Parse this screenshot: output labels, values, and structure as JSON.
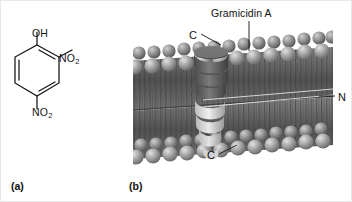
{
  "figure": {
    "parts": [
      {
        "letter": "(a)",
        "caption_icon": "chemical-structure"
      },
      {
        "letter": "(b)",
        "caption_icon": "membrane-diagram"
      }
    ]
  },
  "panel_a": {
    "molecule_name": "2,4-dinitrophenol",
    "labels": {
      "hydroxyl": "OH",
      "nitro_ortho_text": "NO",
      "nitro_ortho_sub": "2",
      "nitro_para_text": "NO",
      "nitro_para_sub": "2"
    }
  },
  "panel_b": {
    "title": "Gramicidin A",
    "labels": {
      "c_terminus_top": "C",
      "c_terminus_bottom": "C",
      "n_terminus": "N"
    },
    "scene": {
      "description": "lipid-bilayer-with-helical-channel",
      "bilayer_head_color": "#9a9a9a",
      "bilayer_tail_color": "#5c5c5c",
      "helix_color": "#6f6f6f",
      "background_color": "#ffffff"
    }
  }
}
